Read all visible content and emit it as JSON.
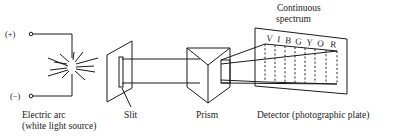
{
  "figure": {
    "terminals": {
      "positive": "(+)",
      "negative": "(−)"
    },
    "labels": {
      "source_line1": "Electric arc",
      "source_line2": "(white light source)",
      "slit": "Slit",
      "prism": "Prism",
      "detector": "Detector (photographic plate)",
      "spectrum_line1": "Continuous",
      "spectrum_line2": "spectrum"
    },
    "spectrum_colors": [
      "V",
      "I",
      "B",
      "G",
      "Y",
      "O",
      "R"
    ],
    "components": [
      {
        "name": "electric-arc",
        "role": "white light source"
      },
      {
        "name": "slit",
        "role": "narrows beam"
      },
      {
        "name": "prism",
        "role": "disperses light"
      },
      {
        "name": "detector",
        "role": "photographic plate"
      }
    ],
    "line_color": "#1a1a1a",
    "background": "#ffffff"
  }
}
